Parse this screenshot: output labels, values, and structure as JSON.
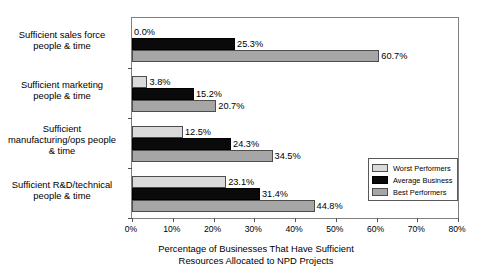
{
  "chart_data": {
    "type": "bar",
    "orientation": "horizontal",
    "title": "",
    "xlabel": "Percentage of Businesses That Have Sufficient Resources Allocated to NPD Projects",
    "ylabel": "",
    "xlim": [
      0,
      80
    ],
    "xticks": [
      "0%",
      "10%",
      "20%",
      "30%",
      "40%",
      "50%",
      "60%",
      "70%",
      "80%"
    ],
    "grid": false,
    "legend_position": "inside-right",
    "categories": [
      "Sufficient sales force people & time",
      "Sufficient marketing people & time",
      "Sufficient manufacturing/ops people & time",
      "Sufficient R&D/technical people & time"
    ],
    "series": [
      {
        "name": "Worst Performers",
        "color": "#D9D9D9",
        "values": [
          0.0,
          3.8,
          12.5,
          23.1
        ],
        "labels": [
          "0.0%",
          "3.8%",
          "12.5%",
          "23.1%"
        ]
      },
      {
        "name": "Average Business",
        "color": "#0A0A0A",
        "values": [
          25.3,
          15.2,
          24.3,
          31.4
        ],
        "labels": [
          "25.3%",
          "15.2%",
          "24.3%",
          "31.4%"
        ]
      },
      {
        "name": "Best Performers",
        "color": "#A6A6A6",
        "values": [
          60.7,
          20.7,
          34.5,
          44.8
        ],
        "labels": [
          "60.7%",
          "20.7%",
          "34.5%",
          "44.8%"
        ]
      }
    ]
  },
  "category_labels": [
    {
      "line1": "Sufficient sales force",
      "line2": "people & time"
    },
    {
      "line1": "Sufficient marketing",
      "line2": "people & time"
    },
    {
      "line1": "Sufficient",
      "line2": "manufacturing/ops people",
      "line3": "& time"
    },
    {
      "line1": "Sufficient R&D/technical",
      "line2": "people & time"
    }
  ],
  "axis_title": {
    "line1": "Percentage of Businesses That Have Sufficient",
    "line2": "Resources Allocated to NPD Projects"
  },
  "legend": {
    "items": [
      {
        "label": "Worst Performers",
        "swatch": "worst"
      },
      {
        "label": "Average Business",
        "swatch": "avg"
      },
      {
        "label": "Best Performers",
        "swatch": "best"
      }
    ]
  }
}
